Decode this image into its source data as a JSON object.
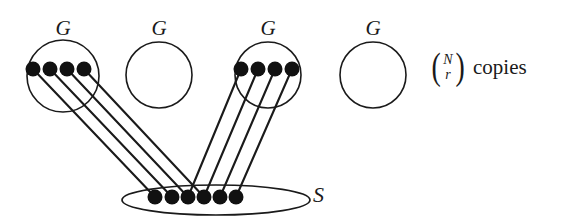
{
  "figure": {
    "background_color": "#ffffff",
    "stroke_color": "#1a1a1a",
    "node_color": "#111111",
    "width": 579,
    "height": 221
  },
  "groups": [
    {
      "label": "G",
      "cx": 63,
      "cy": 76,
      "r": 36,
      "label_x": 43,
      "label_y": 18,
      "node_count": 4,
      "nodes_filled": true
    },
    {
      "label": "G",
      "cx": 159,
      "cy": 75,
      "r": 33,
      "label_x": 139,
      "label_y": 18,
      "node_count": 0,
      "nodes_filled": false
    },
    {
      "label": "G",
      "cx": 268,
      "cy": 75,
      "r": 33,
      "label_x": 248,
      "label_y": 18,
      "node_count": 4,
      "nodes_filled": true
    },
    {
      "label": "G",
      "cx": 373,
      "cy": 75,
      "r": 33,
      "label_x": 353,
      "label_y": 18,
      "node_count": 0,
      "nodes_filled": false
    }
  ],
  "group_nodes": {
    "left": {
      "y": 69,
      "radius": 7.5,
      "x": [
        33,
        50,
        67,
        84
      ]
    },
    "right": {
      "y": 69,
      "radius": 7.5,
      "x": [
        241,
        258,
        275,
        292
      ]
    }
  },
  "set": {
    "label": "S",
    "label_x": 313,
    "label_y": 184,
    "ellipse_cx": 216,
    "ellipse_cy": 200,
    "ellipse_rx": 94,
    "ellipse_ry": 15,
    "node_y": 197,
    "node_radius": 7.5,
    "node_x": [
      155,
      172,
      188,
      204,
      220,
      236
    ]
  },
  "edges": {
    "left_group_targets": [
      0,
      1,
      2,
      3
    ],
    "right_group_targets": [
      2,
      3,
      4,
      5
    ],
    "stroke_width": 2.1
  },
  "annotation": {
    "binomial_top": "N",
    "binomial_bottom": "r",
    "left_paren": "(",
    "right_paren": ")",
    "copies_label": "copies"
  }
}
